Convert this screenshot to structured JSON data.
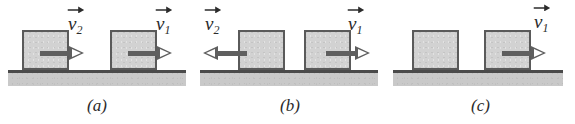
{
  "figure": {
    "colors": {
      "block_fill": "#d2d2d2",
      "block_outline": "#5a5a5a",
      "ground_fill": "#c9c9c9",
      "ground_line": "#4a4a4a",
      "arrow": "#5f5f5f",
      "arrow_head_fill": "#ffffff",
      "text": "#2b2b2b",
      "background": "#ffffff"
    },
    "panels": [
      {
        "id": "a",
        "caption": "(a)",
        "ground": {
          "x": 8,
          "y": 70,
          "width": 178,
          "height": 13
        },
        "blocks": [
          {
            "name": "left-block",
            "x": 22,
            "y": 30,
            "width": 47,
            "height": 40,
            "arrow": {
              "name": "velocity-arrow-v2",
              "direction": "right",
              "x": 40,
              "y": 46,
              "length": 44,
              "shaft_length": 29
            },
            "label": {
              "name": "velocity-label-v2",
              "symbol": "v",
              "subscript": "2",
              "vector_arrow_direction": "right",
              "x": 68,
              "y": 14
            }
          },
          {
            "name": "right-block",
            "x": 110,
            "y": 30,
            "width": 47,
            "height": 40,
            "arrow": {
              "name": "velocity-arrow-v1",
              "direction": "right",
              "x": 128,
              "y": 46,
              "length": 44,
              "shaft_length": 29
            },
            "label": {
              "name": "velocity-label-v1",
              "symbol": "v",
              "subscript": "1",
              "vector_arrow_direction": "right",
              "x": 156,
              "y": 14
            }
          }
        ]
      },
      {
        "id": "b",
        "caption": "(b)",
        "ground": {
          "x": 200,
          "y": 70,
          "width": 178,
          "height": 13
        },
        "blocks": [
          {
            "name": "left-block",
            "x": 238,
            "y": 30,
            "width": 47,
            "height": 40,
            "arrow": {
              "name": "velocity-arrow-v2",
              "direction": "left",
              "x": 203,
              "y": 46,
              "length": 44,
              "shaft_length": 29
            },
            "label": {
              "name": "velocity-label-v2",
              "symbol": "v",
              "subscript": "2",
              "vector_arrow_direction": "right",
              "x": 205,
              "y": 14
            }
          },
          {
            "name": "right-block",
            "x": 304,
            "y": 30,
            "width": 47,
            "height": 40,
            "arrow": {
              "name": "velocity-arrow-v1",
              "direction": "right",
              "x": 326,
              "y": 46,
              "length": 44,
              "shaft_length": 29
            },
            "label": {
              "name": "velocity-label-v1",
              "symbol": "v",
              "subscript": "1",
              "vector_arrow_direction": "right",
              "x": 348,
              "y": 14
            }
          }
        ]
      },
      {
        "id": "c",
        "caption": "(c)",
        "ground": {
          "x": 393,
          "y": 70,
          "width": 170,
          "height": 13
        },
        "blocks": [
          {
            "name": "left-block",
            "x": 412,
            "y": 30,
            "width": 47,
            "height": 40,
            "arrow": null,
            "label": null
          },
          {
            "name": "right-block",
            "x": 484,
            "y": 30,
            "width": 47,
            "height": 40,
            "arrow": {
              "name": "velocity-arrow-v1",
              "direction": "right",
              "x": 502,
              "y": 46,
              "length": 44,
              "shaft_length": 29
            },
            "label": {
              "name": "velocity-label-v1",
              "symbol": "v",
              "subscript": "1",
              "vector_arrow_direction": "right",
              "x": 534,
              "y": 12
            }
          }
        ]
      }
    ]
  }
}
